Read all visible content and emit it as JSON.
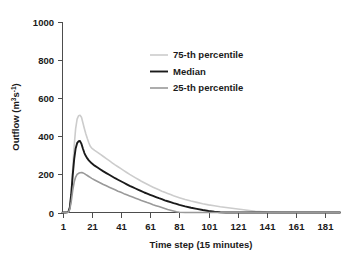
{
  "chart_data": {
    "type": "line",
    "title": "",
    "xlabel": "Time step (15 minutes)",
    "ylabel": "Outflow (m3s-1)",
    "ylabel_base": "Outflow (m",
    "ylabel_sup1": "3",
    "ylabel_mid": "s",
    "ylabel_sup2": "-1",
    "ylabel_end": ")",
    "xlim": [
      1,
      191
    ],
    "ylim": [
      0,
      1000
    ],
    "grid": false,
    "legend_position": "upper-center",
    "xticks": [
      1,
      21,
      41,
      61,
      81,
      101,
      121,
      141,
      161,
      181
    ],
    "xtick_labels": [
      "1",
      "21",
      "41",
      "61",
      "81",
      "101",
      "121",
      "141",
      "161",
      "181"
    ],
    "yticks": [
      0,
      200,
      400,
      600,
      800,
      1000
    ],
    "ytick_labels": [
      "0",
      "200",
      "400",
      "600",
      "800",
      "1000"
    ],
    "x": [
      1,
      3,
      5,
      6,
      7,
      8,
      9,
      10,
      11,
      12,
      13,
      14,
      15,
      16,
      17,
      18,
      19,
      20,
      21,
      23,
      25,
      27,
      29,
      31,
      33,
      35,
      37,
      39,
      41,
      43,
      45,
      47,
      49,
      51,
      53,
      55,
      57,
      59,
      61,
      63,
      65,
      67,
      69,
      71,
      73,
      75,
      77,
      79,
      81,
      85,
      89,
      93,
      97,
      101,
      105,
      109,
      113,
      117,
      121,
      125,
      129,
      133,
      141,
      151,
      161,
      171,
      181,
      191
    ],
    "series": [
      {
        "name": "75-th percentile",
        "color": "#cccccc",
        "linewidth": 1.6,
        "peak_value": 510,
        "peak_x": 13,
        "values": [
          0,
          0,
          2,
          30,
          110,
          230,
          350,
          440,
          490,
          508,
          510,
          500,
          470,
          440,
          412,
          388,
          366,
          348,
          338,
          326,
          316,
          305,
          294,
          283,
          272,
          261,
          250,
          240,
          230,
          220,
          210,
          200,
          191,
          182,
          173,
          164,
          156,
          148,
          140,
          133,
          126,
          119,
          112,
          106,
          100,
          94,
          88,
          83,
          78,
          68,
          60,
          53,
          46,
          40,
          35,
          30,
          26,
          22,
          18,
          14,
          10,
          6,
          2,
          0,
          0,
          0,
          0,
          0
        ]
      },
      {
        "name": "Median",
        "color": "#1a1a1a",
        "linewidth": 1.9,
        "peak_value": 375,
        "peak_x": 13,
        "values": [
          0,
          0,
          2,
          26,
          96,
          196,
          280,
          336,
          364,
          374,
          375,
          360,
          335,
          312,
          296,
          284,
          274,
          266,
          258,
          246,
          236,
          226,
          216,
          207,
          198,
          189,
          180,
          172,
          164,
          156,
          148,
          140,
          133,
          126,
          119,
          112,
          105,
          99,
          93,
          87,
          81,
          75,
          70,
          64,
          59,
          54,
          49,
          45,
          40,
          32,
          25,
          19,
          13,
          8,
          4,
          1,
          0,
          0,
          0,
          0,
          0,
          0,
          0,
          0,
          0,
          0,
          0,
          0
        ]
      },
      {
        "name": "25-th percentile",
        "color": "#999999",
        "linewidth": 1.6,
        "peak_value": 210,
        "peak_x": 14,
        "values": [
          0,
          0,
          1,
          16,
          58,
          116,
          160,
          186,
          200,
          206,
          209,
          210,
          208,
          204,
          199,
          194,
          189,
          184,
          179,
          171,
          163,
          155,
          147,
          140,
          133,
          126,
          119,
          112,
          106,
          99,
          93,
          87,
          81,
          75,
          69,
          63,
          58,
          52,
          47,
          41,
          36,
          31,
          26,
          21,
          16,
          12,
          8,
          4,
          1,
          0,
          0,
          0,
          0,
          0,
          0,
          0,
          0,
          0,
          0,
          0,
          0,
          0,
          0,
          0,
          0,
          0,
          0,
          0
        ]
      }
    ],
    "legend": [
      {
        "label": "75-th percentile",
        "color": "#cccccc"
      },
      {
        "label": "Median",
        "color": "#1a1a1a"
      },
      {
        "label": "25-th percentile",
        "color": "#999999"
      }
    ]
  }
}
